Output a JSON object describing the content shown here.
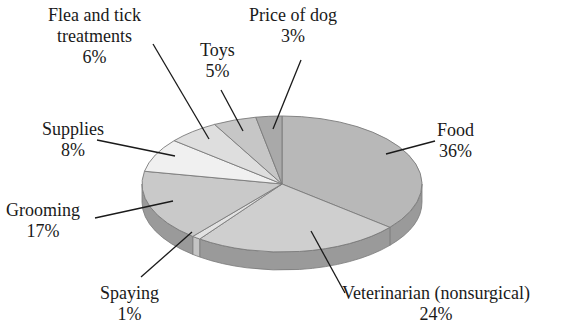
{
  "chart_data": {
    "type": "pie",
    "style": "3d-exploded-none",
    "title": "",
    "start_angle_deg": 90,
    "direction": "clockwise",
    "categories": [
      "Food",
      "Veterinarian (nonsurgical)",
      "Spaying",
      "Grooming",
      "Supplies",
      "Flea and tick treatments",
      "Toys",
      "Price of dog"
    ],
    "values": [
      36,
      24,
      1,
      17,
      8,
      6,
      5,
      3
    ],
    "unit": "%",
    "labels": [
      {
        "name": "Food",
        "pct": "36%"
      },
      {
        "name": "Veterinarian (nonsurgical)",
        "pct": "24%"
      },
      {
        "name": "Spaying",
        "pct": "1%"
      },
      {
        "name": "Grooming",
        "pct": "17%"
      },
      {
        "name": "Supplies",
        "pct": "8%"
      },
      {
        "name": "Flea and tick treatments",
        "pct": "6%"
      },
      {
        "name": "Toys",
        "pct": "5%"
      },
      {
        "name": "Price of dog",
        "pct": "3%"
      }
    ],
    "legend": "none (callout labels with leader lines)"
  },
  "colors": {
    "Food": "#b8b8b8",
    "Veterinarian (nonsurgical)": "#cfcfcf",
    "Spaying": "#e2e2e2",
    "Grooming": "#c9c9c9",
    "Supplies": "#f0f0f0",
    "Flea and tick treatments": "#dedede",
    "Toys": "#c6c6c6",
    "Price of dog": "#a9a9a9",
    "side": "#9a9a9a",
    "outline": "#7a7a7a"
  },
  "text": {
    "food_name": "Food",
    "food_pct": "36%",
    "vet_name": "Veterinarian (nonsurgical)",
    "vet_pct": "24%",
    "spay_name": "Spaying",
    "spay_pct": "1%",
    "groom_name": "Grooming",
    "groom_pct": "17%",
    "supplies_name": "Supplies",
    "supplies_pct": "8%",
    "flea_name1": "Flea and tick",
    "flea_name2": "treatments",
    "flea_pct": "6%",
    "toys_name": "Toys",
    "toys_pct": "5%",
    "price_name": "Price of dog",
    "price_pct": "3%"
  }
}
